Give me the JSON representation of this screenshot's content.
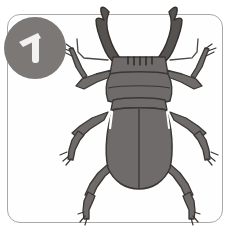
{
  "card": {
    "name": "illustration-card",
    "background_color": "#ffffff",
    "frame": {
      "border_color": "#a9a9a9",
      "fill_color": "#fefefe",
      "corner_radius": 13,
      "x": 7,
      "y": 14,
      "width": 216,
      "height": 209
    }
  },
  "badge": {
    "label": "1",
    "shape": "circle",
    "fill_color": "#7b7876",
    "text_color": "#f2f2f0",
    "diameter": 62,
    "x": 4,
    "y": 17
  },
  "illustration": {
    "subject": "stag-beetle",
    "title": "Stag beetle",
    "style": "hand-drawn line art, flat gray fill",
    "orientation": "dorsal view, head up",
    "body_fill": "#6e6b6a",
    "body_fill_light": "#7a7776",
    "outline_color": "#3a3734",
    "highlight_color": "#ffffff",
    "parts": [
      {
        "name": "left-mandible",
        "label": "Left mandible"
      },
      {
        "name": "right-mandible",
        "label": "Right mandible"
      },
      {
        "name": "head",
        "label": "Head"
      },
      {
        "name": "pronotum",
        "label": "Pronotum"
      },
      {
        "name": "elytra",
        "label": "Elytra"
      },
      {
        "name": "left-antenna",
        "label": "Left antenna"
      },
      {
        "name": "right-antenna",
        "label": "Right antenna"
      },
      {
        "name": "front-left-leg",
        "label": "Front left leg"
      },
      {
        "name": "front-right-leg",
        "label": "Front right leg"
      },
      {
        "name": "middle-left-leg",
        "label": "Middle left leg"
      },
      {
        "name": "middle-right-leg",
        "label": "Middle right leg"
      },
      {
        "name": "hind-left-leg",
        "label": "Hind left leg"
      },
      {
        "name": "hind-right-leg",
        "label": "Hind right leg"
      }
    ]
  }
}
